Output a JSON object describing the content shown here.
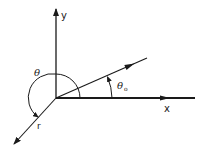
{
  "diagram": {
    "labels": {
      "y_axis": "y",
      "x_axis": "x",
      "theta": "θ",
      "theta0": "θ",
      "theta0_subscript": "o",
      "r": "r"
    },
    "colors": {
      "line": "#1a1a1a",
      "background": "#ffffff"
    }
  }
}
